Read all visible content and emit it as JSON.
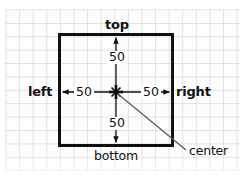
{
  "diagram": {
    "colors": {
      "ink": "#111111",
      "grid": "#d9dcdf",
      "paper": "#fdfdfd",
      "leader": "#555555"
    },
    "box": {
      "name": "reference-square",
      "stroke_width": 3
    },
    "edge_labels": {
      "top": "top",
      "bottom": "bottom",
      "left": "left",
      "right": "right"
    },
    "measurements": {
      "top": "50",
      "bottom": "50",
      "left": "50",
      "right": "50"
    },
    "center": {
      "label": "center",
      "marker": "cross-marker"
    }
  }
}
